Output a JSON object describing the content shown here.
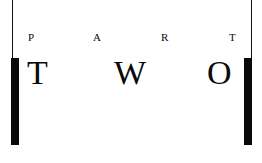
{
  "heading": {
    "small_letters": [
      "P",
      "A",
      "R",
      "T"
    ],
    "large_letters": [
      "T",
      "W",
      "O"
    ]
  },
  "colors": {
    "ink": "#0a0a0a",
    "background": "#ffffff"
  }
}
